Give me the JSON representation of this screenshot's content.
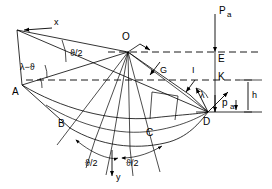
{
  "figure": {
    "type": "engineering-geometry-diagram",
    "background_color": "#ffffff",
    "line_color": "#000000",
    "width": 272,
    "height": 189
  },
  "points": [
    {
      "id": "A",
      "label": "A",
      "x": 22,
      "y": 85,
      "label_x": 12,
      "label_y": 94
    },
    {
      "id": "B",
      "label": "B",
      "x": 70,
      "y": 128,
      "label_x": 62,
      "label_y": 126
    },
    {
      "id": "C",
      "label": "C",
      "x": 152,
      "y": 140,
      "label_x": 145,
      "label_y": 135
    },
    {
      "id": "D",
      "label": "D",
      "x": 208,
      "y": 112,
      "label_x": 204,
      "label_y": 124
    },
    {
      "id": "O",
      "label": "O",
      "x": 128,
      "y": 52,
      "label_x": 124,
      "label_y": 39
    },
    {
      "id": "E",
      "label": "E",
      "x": 215,
      "y": 52,
      "label_x": 218,
      "label_y": 61
    },
    {
      "id": "K",
      "label": "K",
      "x": 215,
      "y": 70,
      "label_x": 218,
      "label_y": 79
    }
  ],
  "labels": {
    "x_axis": "x",
    "y_axis": "y",
    "segment_G": "G",
    "segment_I": "I",
    "height_h": "h",
    "load_top": "P",
    "load_top_sub": "a",
    "load_bottom": "p",
    "load_bottom_sub": "a",
    "angle_lambda_minus_theta": "λ−ϑ",
    "angle_theta_half": "ϑ/2",
    "angle_theta_half_left": "ϑ/2",
    "angle_theta_half_right": "ϑ/2",
    "angle_lambda": "λ"
  },
  "annotations": [
    {
      "name": "x-axis-label",
      "text": "x",
      "x": 38,
      "y": 24
    },
    {
      "name": "y-axis-label",
      "text": "y",
      "x": 115,
      "y": 178
    },
    {
      "name": "theta-half-upper",
      "text": "ϑ/2",
      "x": 72,
      "y": 53
    },
    {
      "name": "lambda-minus-theta-label",
      "text": "λ−ϑ",
      "x": 24,
      "y": 67
    },
    {
      "name": "segment-g-label",
      "text": "G",
      "x": 163,
      "y": 70
    },
    {
      "name": "segment-i-label",
      "text": "I",
      "x": 194,
      "y": 70
    },
    {
      "name": "lambda-label",
      "text": "λ",
      "x": 202,
      "y": 95
    },
    {
      "name": "height-h-label",
      "text": "h",
      "x": 253,
      "y": 96
    },
    {
      "name": "theta-half-bottom-left",
      "text": "ϑ/2",
      "x": 93,
      "y": 163
    },
    {
      "name": "theta-half-bottom-right",
      "text": "ϑ/2",
      "x": 133,
      "y": 163
    }
  ]
}
